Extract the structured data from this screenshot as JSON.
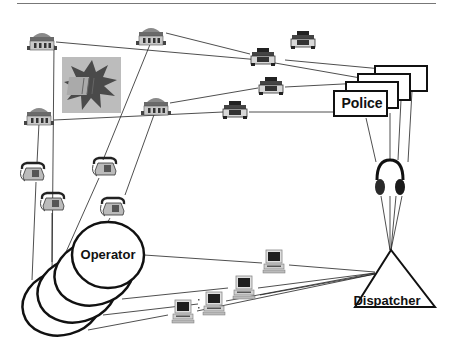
{
  "diagram": {
    "labels": {
      "police": "Police",
      "operator": "Operator",
      "dispatcher": "Dispatcher"
    },
    "nodes": {
      "houses": [
        {
          "id": "house-1",
          "x": 42,
          "y": 40
        },
        {
          "id": "house-2",
          "x": 151,
          "y": 35
        },
        {
          "id": "house-3",
          "x": 39,
          "y": 115
        },
        {
          "id": "house-4",
          "x": 156,
          "y": 105
        }
      ],
      "phones": [
        {
          "id": "phone-1",
          "x": 33,
          "y": 172
        },
        {
          "id": "phone-2",
          "x": 53,
          "y": 202
        },
        {
          "id": "phone-3",
          "x": 105,
          "y": 167
        },
        {
          "id": "phone-4",
          "x": 113,
          "y": 207
        }
      ],
      "cars": [
        {
          "id": "car-1",
          "x": 303,
          "y": 40
        },
        {
          "id": "car-2",
          "x": 263,
          "y": 57
        },
        {
          "id": "car-3",
          "x": 271,
          "y": 86
        },
        {
          "id": "car-4",
          "x": 235,
          "y": 110
        }
      ],
      "computers": [
        {
          "id": "computer-1",
          "x": 274,
          "y": 262
        },
        {
          "id": "computer-2",
          "x": 244,
          "y": 288
        },
        {
          "id": "computer-3",
          "x": 214,
          "y": 304
        },
        {
          "id": "computer-4",
          "x": 183,
          "y": 312
        }
      ],
      "police_stack_count": 4,
      "operator_stack_count": 4
    },
    "icons": {
      "boom": "explosion-icon",
      "headset": "headphones-icon",
      "house": "house-icon",
      "phone": "telephone-icon",
      "car": "police-car-icon",
      "computer": "computer-icon"
    },
    "colors": {
      "line": "#222222",
      "outline": "#111111",
      "boom_bg": "#b8b8b8",
      "boom_star": "#555555",
      "icon_gray": "#8a8a8a",
      "icon_dark": "#333333"
    }
  }
}
